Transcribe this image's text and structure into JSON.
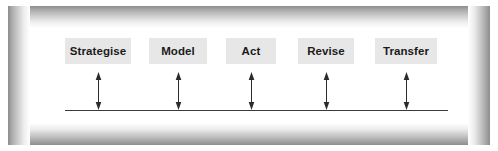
{
  "diagram": {
    "frame": {
      "style": "beveled-gradient-border",
      "outer_color": "#8c8c8c",
      "inner_color": "#ffffff"
    },
    "node_fill": "#e7e7e7",
    "node_text_color": "#1b1b1b",
    "arrow_color": "#2b2b2b",
    "baseline_color": "#3a3a3a",
    "nodes": [
      {
        "label": "Strategise",
        "left": 35,
        "width": 66,
        "arrow_x": 68
      },
      {
        "label": "Model",
        "left": 119,
        "width": 58,
        "arrow_x": 148
      },
      {
        "label": "Act",
        "left": 196,
        "width": 50,
        "arrow_x": 221
      },
      {
        "label": "Revise",
        "left": 268,
        "width": 56,
        "arrow_x": 296
      },
      {
        "label": "Transfer",
        "left": 345,
        "width": 62,
        "arrow_x": 376
      }
    ],
    "connectors": {
      "type": "double-headed-vertical-arrow",
      "count": 5,
      "description": "Each node connects down to the horizontal baseline with a bidirectional arrow"
    },
    "baseline": {
      "left": 35,
      "width": 383,
      "thickness": 1
    }
  }
}
